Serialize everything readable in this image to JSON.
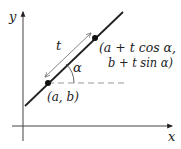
{
  "diagram": {
    "type": "parametric-line",
    "axes": {
      "x_label": "x",
      "y_label": "y",
      "origin": [
        23,
        126
      ],
      "x_axis": {
        "from": [
          12,
          126
        ],
        "to": [
          174,
          126
        ]
      },
      "y_axis": {
        "from": [
          23,
          141
        ],
        "to": [
          23,
          10
        ]
      }
    },
    "line": {
      "from": [
        25,
        106
      ],
      "to": [
        123,
        12
      ],
      "color": "#222222"
    },
    "points": [
      {
        "id": "start",
        "at": [
          48,
          83
        ],
        "label": "(a, b)"
      },
      {
        "id": "end",
        "at": [
          95,
          38
        ],
        "label_line1": "(a + t cos α,",
        "label_line2": "b + t sin α)"
      }
    ],
    "dashed_reference": {
      "from": [
        48,
        83
      ],
      "to": [
        124,
        83
      ],
      "color": "#999999"
    },
    "distance_arrow": {
      "from": [
        45,
        77
      ],
      "to": [
        92,
        33
      ],
      "label": "t",
      "color": "#777777"
    },
    "angle": {
      "label": "α",
      "center": [
        48,
        83
      ],
      "radius": 26
    },
    "colors": {
      "ink": "#222222",
      "axis": "#444444",
      "dashed": "#999999",
      "arrow": "#777777"
    }
  }
}
